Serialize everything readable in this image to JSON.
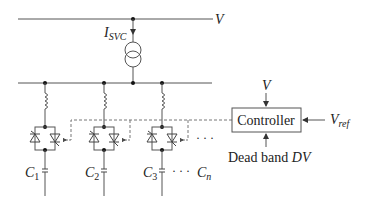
{
  "diagram": {
    "bus_label": "V",
    "current_label_main": "I",
    "current_label_sub": "SVC",
    "controller": {
      "label": "Controller",
      "input_top": "V",
      "input_right_main": "V",
      "input_right_sub": "ref",
      "input_bottom_text": "Dead band ",
      "input_bottom_var": "DV"
    },
    "branches": [
      {
        "cap_main": "C",
        "cap_sub": "1"
      },
      {
        "cap_main": "C",
        "cap_sub": "2"
      },
      {
        "cap_main": "C",
        "cap_sub": "3"
      }
    ],
    "ellipsis_mid": "· · ·",
    "ellipsis_bottom": "· · ·",
    "last_cap_main": "C",
    "last_cap_sub": "n",
    "colors": {
      "line": "#555555",
      "text": "#222222",
      "dashed": "#777777"
    }
  }
}
